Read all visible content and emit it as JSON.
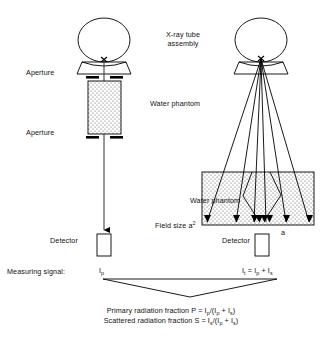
{
  "figure": {
    "width": 323,
    "height": 338,
    "stroke_color": "#000000",
    "fill_phantom": "#ffffff",
    "stipple_color": "#444444"
  },
  "labels": {
    "xray_tube_assembly": "X-ray tube assembly",
    "aperture_top": "Aperture",
    "aperture_bottom": "Aperture",
    "water_phantom_left": "Water phantom",
    "water_phantom_right": "Water phantom",
    "field_size": "Field size a",
    "field_size_exponent": "2",
    "edge_length": "a",
    "detector_left": "Detector",
    "detector_right": "Detector",
    "measuring_signal": "Measuring signal:",
    "focal_spot_marker": "x"
  },
  "signals": {
    "left": {
      "symbol": "I",
      "subscript": "p"
    },
    "right": {
      "lhs_symbol": "I",
      "lhs_subscript": "t",
      "equals": " = ",
      "term1_symbol": "I",
      "term1_subscript": "p",
      "plus": " + ",
      "term2_symbol": "I",
      "term2_subscript": "s"
    }
  },
  "formulas": {
    "primary": {
      "text_before": "Primary radiation fraction P = I",
      "sub1": "p",
      "mid": "/(I",
      "sub2": "p",
      "mid2": " + I",
      "sub3": "s",
      "text_after": ")"
    },
    "scattered": {
      "text_before": "Scattered radiation fraction S = I",
      "sub1": "s",
      "mid": "/(I",
      "sub2": "p",
      "mid2": " + I",
      "sub3": "s",
      "text_after": ")"
    }
  },
  "geometry": {
    "left_setup": {
      "tube_circle": {
        "cx": 104,
        "cy": 40,
        "rx": 26,
        "ry": 22
      },
      "housing": {
        "x1": 84,
        "y1": 62,
        "x2": 124,
        "y2": 62,
        "x3": 129,
        "y3": 72,
        "x4": 79,
        "y4": 72
      },
      "focal_spot": {
        "x": 104,
        "y": 60
      },
      "aperture_top_y": 77,
      "aperture_bottom_y": 137,
      "phantom": {
        "x": 88,
        "y": 81,
        "w": 33,
        "h": 53
      },
      "beam_line": {
        "x": 104,
        "y_start": 60,
        "y_end": 231
      },
      "detector": {
        "x": 96,
        "y": 234,
        "w": 14,
        "h": 22
      }
    },
    "right_setup": {
      "tube_circle": {
        "cx": 261,
        "cy": 40,
        "rx": 26,
        "ry": 22
      },
      "housing": {
        "x1": 241,
        "y1": 62,
        "x2": 281,
        "y2": 62,
        "x3": 286,
        "y3": 72,
        "x4": 236,
        "y4": 72
      },
      "focal_spot": {
        "x": 261,
        "y": 60
      },
      "phantom": {
        "x": 202,
        "y": 172,
        "w": 112,
        "h": 53
      },
      "detector": {
        "x": 254,
        "y": 234,
        "w": 14,
        "h": 22
      },
      "ray_count": 6
    },
    "connector_v": {
      "left_x": 103,
      "right_x": 277,
      "top_y": 279,
      "apex_x": 190,
      "apex_y": 297
    }
  }
}
